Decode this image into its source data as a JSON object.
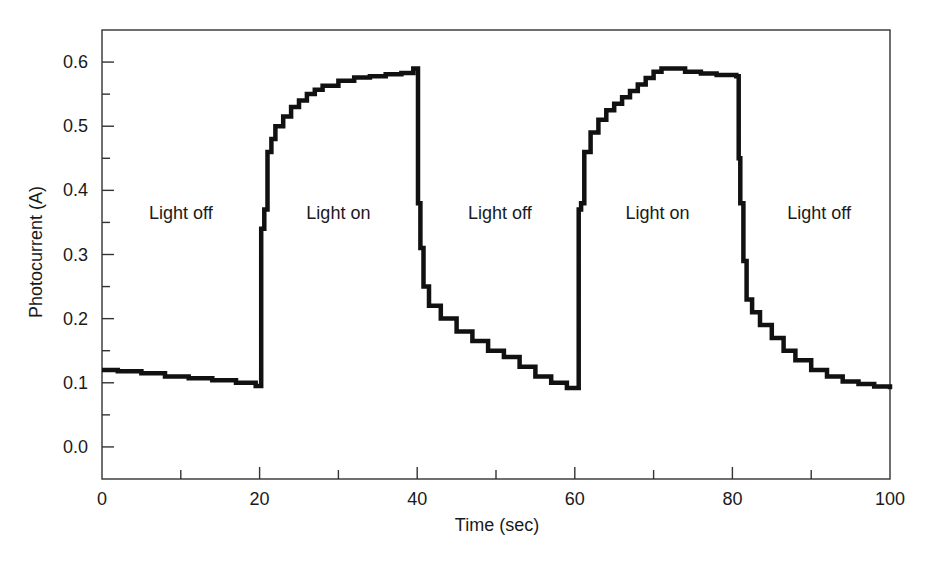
{
  "chart_data": {
    "type": "line",
    "title": "",
    "xlabel": "Time (sec)",
    "ylabel": "Photocurrent (A)",
    "xlim": [
      0,
      100
    ],
    "ylim": [
      -0.05,
      0.65
    ],
    "xticks": [
      0,
      20,
      40,
      60,
      80,
      100
    ],
    "xtick_labels": [
      "0",
      "20",
      "40",
      "60",
      "80",
      "100"
    ],
    "xminor_ticks": [
      10,
      30,
      50,
      70,
      90
    ],
    "yticks": [
      0.0,
      0.1,
      0.2,
      0.3,
      0.4,
      0.5,
      0.6
    ],
    "ytick_labels": [
      "0.0",
      "0.1",
      "0.2",
      "0.3",
      "0.4",
      "0.5",
      "0.6"
    ],
    "yminor_ticks": [
      -0.05,
      0.05,
      0.15,
      0.25,
      0.35,
      0.45,
      0.55
    ],
    "grid": false,
    "legend": null,
    "annotations": [
      {
        "text": "Light off",
        "x": 10,
        "y": 0.355
      },
      {
        "text": "Light on",
        "x": 30,
        "y": 0.355
      },
      {
        "text": "Light off",
        "x": 50.5,
        "y": 0.355
      },
      {
        "text": "Light on",
        "x": 70.5,
        "y": 0.355
      },
      {
        "text": "Light off",
        "x": 91,
        "y": 0.355
      }
    ],
    "series": [
      {
        "name": "Photocurrent",
        "color": "#111111",
        "x": [
          0,
          2,
          5,
          8,
          11,
          14,
          17,
          19.5,
          20,
          20.2,
          20.6,
          21,
          21.5,
          22,
          23,
          24,
          25,
          26,
          27,
          28,
          30,
          32,
          34,
          36,
          38,
          39.5,
          40,
          40.1,
          40.4,
          40.8,
          41.5,
          43,
          45,
          47,
          49,
          51,
          53,
          55,
          57,
          59,
          60.3,
          60.5,
          60.8,
          61.2,
          62,
          63,
          64,
          65,
          66,
          67,
          68,
          69,
          70,
          71,
          72,
          74,
          76,
          78,
          80.5,
          80.8,
          81,
          81.4,
          81.8,
          82.5,
          83.5,
          85,
          86.5,
          88,
          90,
          92,
          94,
          96,
          98,
          100
        ],
        "y": [
          0.12,
          0.118,
          0.115,
          0.11,
          0.107,
          0.104,
          0.1,
          0.095,
          0.095,
          0.34,
          0.37,
          0.46,
          0.48,
          0.5,
          0.515,
          0.53,
          0.54,
          0.55,
          0.557,
          0.563,
          0.571,
          0.576,
          0.578,
          0.581,
          0.583,
          0.59,
          0.59,
          0.38,
          0.31,
          0.25,
          0.22,
          0.2,
          0.18,
          0.165,
          0.15,
          0.14,
          0.125,
          0.11,
          0.1,
          0.092,
          0.092,
          0.37,
          0.38,
          0.46,
          0.49,
          0.51,
          0.525,
          0.535,
          0.545,
          0.555,
          0.565,
          0.575,
          0.585,
          0.59,
          0.59,
          0.585,
          0.582,
          0.58,
          0.578,
          0.45,
          0.38,
          0.29,
          0.23,
          0.21,
          0.19,
          0.17,
          0.15,
          0.135,
          0.12,
          0.11,
          0.102,
          0.098,
          0.094,
          0.09
        ]
      }
    ]
  }
}
